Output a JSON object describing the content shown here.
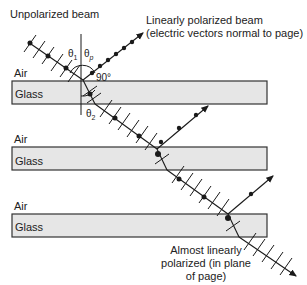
{
  "diagram": {
    "title_labels": {
      "unpolarized": "Unpolarized beam",
      "linear_line1": "Linearly polarized beam",
      "linear_line2": "(electric vectors normal to page)",
      "almost_line1": "Almost linearly",
      "almost_line2": "polarized (in plane",
      "almost_line3": "of page)"
    },
    "angles": {
      "theta1": "θ",
      "theta1_sub": "1",
      "thetap": "θ",
      "thetap_sub": "p",
      "theta2": "θ",
      "theta2_sub": "2",
      "right_angle": "90°"
    },
    "layers": [
      {
        "air": "Air",
        "glass": "Glass"
      },
      {
        "air": "Air",
        "glass": "Glass"
      },
      {
        "air": "Air",
        "glass": "Glass"
      }
    ],
    "colors": {
      "glass_fill": "#e6e6e6",
      "line": "#1a1a1a"
    }
  }
}
